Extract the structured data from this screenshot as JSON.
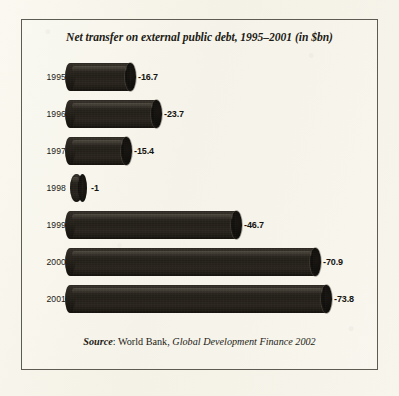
{
  "figure": {
    "title": "Net transfer on external public debt, 1995–2001 (in $bn)",
    "source_prefix": "Source",
    "source_colon": ": ",
    "source_org": "World Bank, ",
    "source_publication": "Global Development Finance 2002",
    "background_color": "#f6f4ea",
    "frame_color": "#5d5c52",
    "bar_color": "#241f19",
    "text_color": "#1d1b16"
  },
  "chart_data": {
    "type": "bar",
    "orientation": "horizontal",
    "title": "Net transfer on external public debt, 1995–2001 (in $bn)",
    "xlabel": "",
    "ylabel": "",
    "categories": [
      "1995",
      "1996",
      "1997",
      "1998",
      "1999",
      "2000",
      "2001"
    ],
    "values": [
      -16.7,
      -23.7,
      -15.4,
      -1,
      -46.7,
      -70.9,
      -73.8
    ],
    "value_labels": [
      "-16.7",
      "-23.7",
      "-15.4",
      "-1",
      "-46.7",
      "-70.9",
      "-73.8"
    ],
    "units": "$bn",
    "xlim": [
      -80,
      0
    ],
    "grid": false,
    "legend": false,
    "series": [
      {
        "name": "Net transfer on external public debt",
        "values": [
          -16.7,
          -23.7,
          -15.4,
          -1,
          -46.7,
          -70.9,
          -73.8
        ]
      }
    ]
  },
  "rows": [
    {
      "year": "1995",
      "value_label": "-16.7",
      "bar_width_px": 61,
      "label_left_px": 138,
      "top_px": 62
    },
    {
      "year": "1996",
      "value_label": "-23.7",
      "bar_width_px": 87,
      "label_left_px": 164,
      "top_px": 99
    },
    {
      "year": "1997",
      "value_label": "-15.4",
      "bar_width_px": 57,
      "label_left_px": 134,
      "top_px": 136
    },
    {
      "year": "1998",
      "value_label": "-1",
      "bar_width_px": 13,
      "label_left_px": 91,
      "top_px": 173
    },
    {
      "year": "1999",
      "value_label": "-46.7",
      "bar_width_px": 167,
      "label_left_px": 244,
      "top_px": 210
    },
    {
      "year": "2000",
      "value_label": "-70.9",
      "bar_width_px": 246,
      "label_left_px": 323,
      "top_px": 247
    },
    {
      "year": "2001",
      "value_label": "-73.8",
      "bar_width_px": 257,
      "label_left_px": 334,
      "top_px": 284
    }
  ]
}
